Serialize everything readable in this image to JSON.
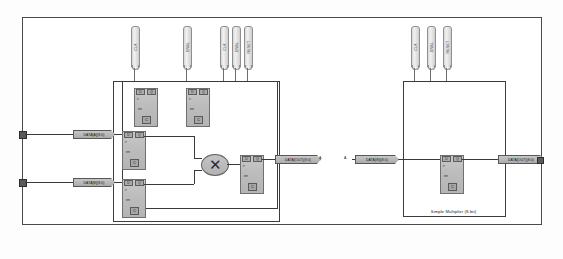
{
  "sheet": {
    "title": "Simple Multiplier (8-bit) schematic sheet"
  },
  "modules": [
    {
      "id": "module-left",
      "name": "multiplier-core",
      "caption": ""
    },
    {
      "id": "module-right",
      "name": "simple-multiplier",
      "caption": "Simple Multiplier (8-bit)"
    }
  ],
  "top_pins": [
    {
      "label": "CLK"
    },
    {
      "label": "ENBL"
    },
    {
      "label": "CLK"
    },
    {
      "label": "ENBL"
    },
    {
      "label": "RESET"
    }
  ],
  "right_pins": [
    {
      "label": "CLK"
    },
    {
      "label": "ENBL"
    },
    {
      "label": "RESET"
    }
  ],
  "registers": [
    {
      "name": "reg-clk-a",
      "d": "D",
      "q": "Q",
      "en": "en",
      "clk": "C"
    },
    {
      "name": "reg-clk-b",
      "d": "D",
      "q": "Q",
      "en": "en",
      "clk": "C"
    },
    {
      "name": "reg-in-a",
      "d": "D",
      "q": "Q",
      "en": "en",
      "clk": "C"
    },
    {
      "name": "reg-in-b",
      "d": "D",
      "q": "Q",
      "en": "en",
      "clk": "C"
    },
    {
      "name": "reg-out",
      "d": "D",
      "q": "Q",
      "en": "en",
      "clk": "C"
    },
    {
      "name": "reg-right",
      "d": "D",
      "q": "Q",
      "en": "en",
      "clk": "C"
    }
  ],
  "multiplier": {
    "symbol": "✕",
    "name": "multiply-operator"
  },
  "bus_tags": {
    "input_a": "DATA[A](8:0)",
    "input_b": "DATA[B](8:0)",
    "core_out": "DATA[OUT](8:0)",
    "right_in": "DATA[IN](8:0)",
    "right_out": "DATA[OUT](8:0)"
  },
  "net_labels": {
    "left_junction": "A",
    "right_junction": "A"
  },
  "colors": {
    "sheet_border": "#4a4a4a",
    "module_border": "#3c3c3c",
    "wire": "#3a3a3a",
    "block_fill": "#bdbdbd",
    "block_border": "#6f6f6f",
    "tag_fill": "#ababab",
    "terminal": "#5a5a5a",
    "background": "#ffffff"
  }
}
